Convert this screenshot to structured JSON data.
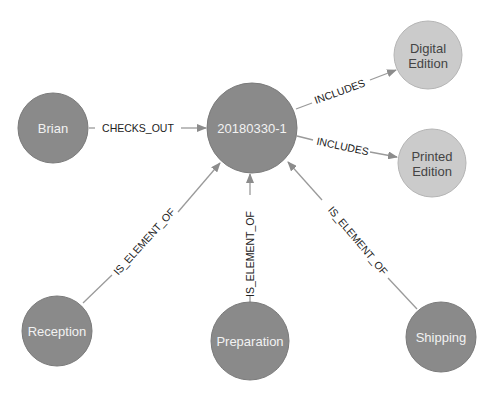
{
  "diagram": {
    "type": "graph",
    "colors": {
      "dark_node": "#8a8a8a",
      "light_node": "#cbcbcb",
      "edge": "#9a9a9a",
      "background": "#ffffff"
    },
    "nodes": [
      {
        "id": "brian",
        "label": "Brian",
        "style": "dark"
      },
      {
        "id": "order",
        "label": "20180330-1",
        "style": "dark"
      },
      {
        "id": "digital",
        "label_line1": "Digital",
        "label_line2": "Edition",
        "style": "light"
      },
      {
        "id": "printed",
        "label_line1": "Printed",
        "label_line2": "Edition",
        "style": "light"
      },
      {
        "id": "reception",
        "label": "Reception",
        "style": "dark"
      },
      {
        "id": "preparation",
        "label": "Preparation",
        "style": "dark"
      },
      {
        "id": "shipping",
        "label": "Shipping",
        "style": "dark"
      }
    ],
    "edges": [
      {
        "from": "brian",
        "to": "order",
        "label": "CHECKS_OUT"
      },
      {
        "from": "order",
        "to": "digital",
        "label": "INCLUDES"
      },
      {
        "from": "order",
        "to": "printed",
        "label": "INCLUDES"
      },
      {
        "from": "reception",
        "to": "order",
        "label": "IS_ELEMENT_OF"
      },
      {
        "from": "preparation",
        "to": "order",
        "label": "IS_ELEMENT_OF"
      },
      {
        "from": "shipping",
        "to": "order",
        "label": "IS_ELEMENT_OF"
      }
    ]
  }
}
